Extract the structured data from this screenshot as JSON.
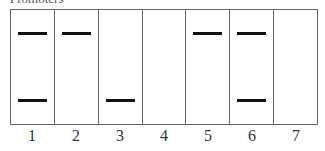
{
  "title_partial": "Promoters",
  "lanes": [
    {
      "label": "1",
      "bands": {
        "top": true,
        "bottom": true
      }
    },
    {
      "label": "2",
      "bands": {
        "top": true,
        "bottom": false
      }
    },
    {
      "label": "3",
      "bands": {
        "top": false,
        "bottom": true
      }
    },
    {
      "label": "4",
      "bands": {
        "top": false,
        "bottom": false
      }
    },
    {
      "label": "5",
      "bands": {
        "top": true,
        "bottom": false
      }
    },
    {
      "label": "6",
      "bands": {
        "top": true,
        "bottom": true
      }
    },
    {
      "label": "7",
      "bands": {
        "top": false,
        "bottom": false
      }
    }
  ]
}
